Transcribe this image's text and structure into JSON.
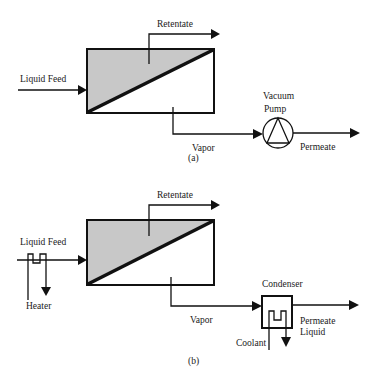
{
  "colors": {
    "retentate_side_fill": "#c8c8c8",
    "line": "#111111",
    "background": "#ffffff"
  },
  "panel_a": {
    "caption": "(a)",
    "labels": {
      "feed": "Liquid Feed",
      "retentate": "Retentate",
      "vapor": "Vapor",
      "pump_line1": "Vacuum",
      "pump_line2": "Pump",
      "permeate": "Permeate"
    },
    "components": [
      "membrane-module",
      "vacuum-pump"
    ]
  },
  "panel_b": {
    "caption": "(b)",
    "labels": {
      "feed": "Liquid Feed",
      "heater": "Heater",
      "retentate": "Retentate",
      "vapor": "Vapor",
      "condenser": "Condenser",
      "coolant": "Coolant",
      "permeate_line1": "Permeate",
      "permeate_line2": "Liquid"
    },
    "components": [
      "heater",
      "membrane-module",
      "condenser"
    ]
  }
}
